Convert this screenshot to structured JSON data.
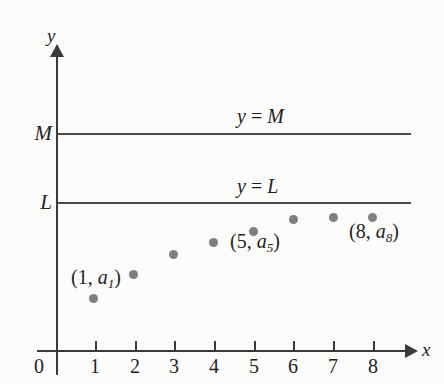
{
  "figure": {
    "background_color": "#fbfbfa",
    "axis_color": "#3b3b3b",
    "line_color": "#4a4a4a",
    "point_color": "#7f7f80"
  },
  "axes": {
    "x_name": "x",
    "y_name": "y",
    "origin_label": "0",
    "x_ticks": [
      {
        "label": "1",
        "x": 95
      },
      {
        "label": "2",
        "x": 135
      },
      {
        "label": "3",
        "x": 174
      },
      {
        "label": "4",
        "x": 214
      },
      {
        "label": "5",
        "x": 254
      },
      {
        "label": "6",
        "x": 293
      },
      {
        "label": "7",
        "x": 333
      },
      {
        "label": "8",
        "x": 373
      }
    ],
    "y_value_labels": [
      {
        "label": "M",
        "y": 133
      },
      {
        "label": "L",
        "y": 202
      }
    ]
  },
  "reference_lines": [
    {
      "id": "M",
      "value_label": "M",
      "annotation_lhs": "y",
      "annotation_eq": " = ",
      "annotation_rhs": "M",
      "annotation": "y = M",
      "y": 133
    },
    {
      "id": "L",
      "value_label": "L",
      "annotation_lhs": "y",
      "annotation_eq": " = ",
      "annotation_rhs": "L",
      "annotation": "y = L",
      "y": 202
    }
  ],
  "chart_data": {
    "type": "scatter",
    "title": "",
    "xlabel": "x",
    "ylabel": "y",
    "grid": false,
    "legend": "none",
    "xlim": [
      0,
      8.9
    ],
    "x": [
      1,
      2,
      3,
      4,
      5,
      6,
      7,
      8
    ],
    "tick_labels": [
      "1",
      "2",
      "3",
      "4",
      "5",
      "6",
      "7",
      "8"
    ],
    "series": [
      {
        "name": "a_n",
        "pixel_points": [
          {
            "n": 1,
            "x": 93,
            "y": 298
          },
          {
            "n": 2,
            "x": 133,
            "y": 274
          },
          {
            "n": 3,
            "x": 173,
            "y": 254
          },
          {
            "n": 4,
            "x": 213,
            "y": 242
          },
          {
            "n": 5,
            "x": 253,
            "y": 231
          },
          {
            "n": 6,
            "x": 293,
            "y": 219
          },
          {
            "n": 7,
            "x": 333,
            "y": 217
          },
          {
            "n": 8,
            "x": 372,
            "y": 217
          }
        ]
      }
    ],
    "reference_levels": [
      {
        "label": "L",
        "annotation": "y = L",
        "pixel_y": 202
      },
      {
        "label": "M",
        "annotation": "y = M",
        "pixel_y": 133
      }
    ],
    "annotations": [
      {
        "text": "(1, a1)",
        "point": 1
      },
      {
        "text": "(5, a5)",
        "point": 5
      },
      {
        "text": "(8, a8)",
        "point": 8
      }
    ]
  },
  "point_annotations": [
    {
      "id": "1",
      "open": "(1, ",
      "var": "a",
      "sub": "1",
      "close": ")",
      "full": "(1, a1)"
    },
    {
      "id": "5",
      "open": "(5, ",
      "var": "a",
      "sub": "5",
      "close": ")",
      "full": "(5, a5)"
    },
    {
      "id": "8",
      "open": "(8, ",
      "var": "a",
      "sub": "8",
      "close": ")",
      "full": "(8, a8)"
    }
  ]
}
